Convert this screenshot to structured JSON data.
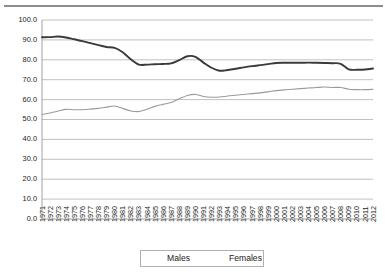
{
  "chart_data": {
    "type": "line",
    "title": "",
    "xlabel": "",
    "ylabel": "",
    "ylim": [
      0.0,
      100.0
    ],
    "ytick_step": 10.0,
    "grid": true,
    "legend_position": "bottom-center",
    "ytick_labels": [
      "100.0",
      "90.0",
      "80.0",
      "70.0",
      "60.0",
      "50.0",
      "40.0",
      "30.0",
      "20.0",
      "10.0",
      "0.0"
    ],
    "ytick_values": [
      100.0,
      90.0,
      80.0,
      70.0,
      60.0,
      50.0,
      40.0,
      30.0,
      20.0,
      10.0,
      0.0
    ],
    "categories": [
      "1971",
      "1972",
      "1973",
      "1974",
      "1975",
      "1976",
      "1977",
      "1978",
      "1979",
      "1980",
      "1981",
      "1982",
      "1983",
      "1984",
      "1985",
      "1986",
      "1987",
      "1988",
      "1989",
      "1990",
      "1991",
      "1992",
      "1993",
      "1994",
      "1995",
      "1996",
      "1997",
      "1998",
      "1999",
      "2000",
      "2001",
      "2002",
      "2003",
      "2004",
      "2005",
      "2006",
      "2007",
      "2008",
      "2009",
      "2010",
      "2011",
      "2012"
    ],
    "series": [
      {
        "name": "Males",
        "color": "#3a3a3a",
        "width": 1.9,
        "values": [
          91.3,
          91.4,
          91.7,
          91.2,
          90.3,
          89.4,
          88.4,
          87.4,
          86.4,
          86.0,
          83.8,
          80.3,
          77.6,
          77.6,
          77.8,
          77.9,
          78.2,
          79.8,
          81.8,
          81.5,
          78.6,
          76.0,
          74.5,
          74.9,
          75.5,
          76.2,
          76.8,
          77.3,
          77.8,
          78.4,
          78.5,
          78.5,
          78.5,
          78.6,
          78.5,
          78.4,
          78.3,
          78.0,
          75.2,
          75.0,
          75.1,
          75.6
        ]
      },
      {
        "name": "Females",
        "color": "#9a9a9a",
        "width": 1.1,
        "values": [
          52.5,
          53.3,
          54.3,
          55.1,
          54.9,
          54.9,
          55.2,
          55.6,
          56.2,
          56.8,
          55.6,
          54.3,
          54.0,
          55.2,
          56.6,
          57.6,
          58.5,
          60.4,
          62.1,
          62.6,
          61.6,
          61.2,
          61.3,
          61.8,
          62.2,
          62.6,
          63.0,
          63.4,
          63.9,
          64.5,
          64.9,
          65.2,
          65.5,
          65.8,
          66.1,
          66.3,
          66.1,
          66.1,
          65.2,
          65.0,
          65.0,
          65.2
        ]
      }
    ]
  },
  "legend": {
    "entries": [
      {
        "label": "Males"
      },
      {
        "label": "Females"
      }
    ]
  },
  "caption": ""
}
